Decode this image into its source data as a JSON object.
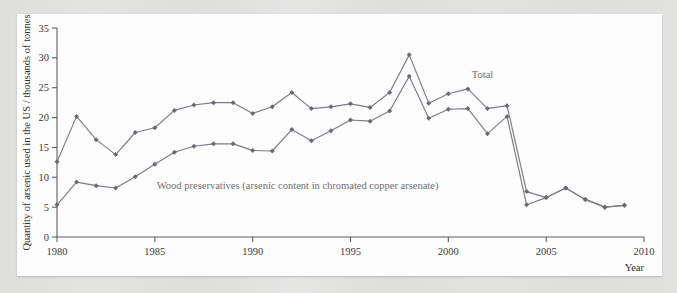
{
  "figure": {
    "background_color": "#dededd",
    "panel_color": "#fdfdfd"
  },
  "chart_data": {
    "type": "line",
    "title": "",
    "xlabel": "Year",
    "ylabel": "Quantity of arsenic used in the US / thousands of tonnes",
    "xlim": [
      1980,
      2010
    ],
    "ylim": [
      0,
      35
    ],
    "xticks": [
      1980,
      1985,
      1990,
      1995,
      2000,
      2005,
      2010
    ],
    "xtick_labels": [
      "1980",
      "1985",
      "1990",
      "1995",
      "2000",
      "2005",
      "2010"
    ],
    "yticks": [
      0,
      5,
      10,
      15,
      20,
      25,
      30,
      35
    ],
    "ytick_labels": [
      "0",
      "5",
      "10",
      "15",
      "20",
      "25",
      "30",
      "35"
    ],
    "grid": false,
    "legend_position": "inline-annotation",
    "line_color": "#7d7a86",
    "marker_color": "#6c6976",
    "x": [
      1980,
      1981,
      1982,
      1983,
      1984,
      1985,
      1986,
      1987,
      1988,
      1989,
      1990,
      1991,
      1992,
      1993,
      1994,
      1995,
      1996,
      1997,
      1998,
      1999,
      2000,
      2001,
      2002,
      2003,
      2004,
      2005,
      2006,
      2007,
      2008,
      2009
    ],
    "series": [
      {
        "name": "Total",
        "label": "Total",
        "values": [
          12.6,
          20.2,
          16.3,
          13.8,
          17.5,
          18.3,
          21.2,
          22.1,
          22.5,
          22.5,
          20.7,
          21.8,
          24.2,
          21.5,
          21.8,
          22.3,
          21.7,
          24.2,
          30.5,
          22.4,
          24.0,
          24.8,
          21.5,
          22.0,
          7.6,
          6.6,
          8.2,
          6.3,
          5.0,
          5.3
        ]
      },
      {
        "name": "Wood preservatives",
        "label": "Wood preservatives (arsenic content in chromated copper arsenate)",
        "values": [
          5.4,
          9.2,
          8.6,
          8.2,
          10.1,
          12.2,
          14.2,
          15.2,
          15.6,
          15.6,
          14.5,
          14.4,
          18.0,
          16.1,
          17.8,
          19.6,
          19.4,
          21.1,
          26.9,
          19.9,
          21.4,
          21.5,
          17.3,
          20.2,
          5.4,
          6.6,
          8.2,
          6.3,
          5.0,
          5.3
        ]
      }
    ],
    "annotations": [
      {
        "name": "total-label",
        "text": "Total",
        "x": 2001.2,
        "y": 26.6
      },
      {
        "name": "wood-preservatives-label",
        "text": "Wood preservatives (arsenic content in chromated copper arsenate)",
        "x": 1985.1,
        "y": 8.0
      }
    ]
  }
}
